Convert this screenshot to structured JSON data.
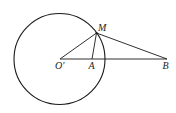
{
  "diagram": {
    "stroke_color": "#1a1a1a",
    "background": "#ffffff",
    "circle": {
      "center": "O'",
      "cx": 59.5,
      "cy": 59,
      "r": 45.5
    },
    "points": {
      "O": {
        "label": "O'",
        "x": 60,
        "y": 59
      },
      "A": {
        "label": "A",
        "x": 92,
        "y": 59
      },
      "M": {
        "label": "M",
        "x": 96.5,
        "y": 33
      },
      "B": {
        "label": "B",
        "x": 167,
        "y": 59
      }
    },
    "segments": [
      [
        "O'",
        "B"
      ],
      [
        "O'",
        "M"
      ],
      [
        "M",
        "A"
      ],
      [
        "M",
        "B"
      ]
    ]
  }
}
